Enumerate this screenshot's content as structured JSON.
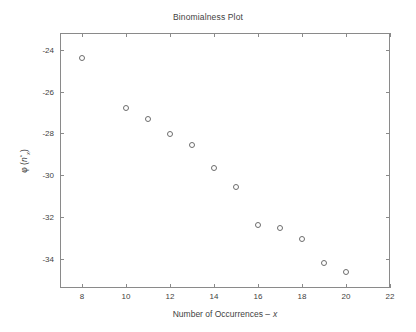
{
  "chart_data": {
    "type": "scatter",
    "title": "Binomialness Plot",
    "xlabel": "Number of Occurrences – x",
    "xlabel_plain": "Number of Occurrences –",
    "xlabel_var": "x",
    "ylabel": "φ (ñ*x)",
    "ylabel_phi": "φ (",
    "ylabel_var": "n",
    "ylabel_sup": "*",
    "ylabel_sub": "x",
    "ylabel_close": ")",
    "xlim": [
      7,
      22
    ],
    "ylim": [
      -35.4,
      -23.2
    ],
    "grid": false,
    "legend": null,
    "marker": "open-circle",
    "marker_color": "#6d6d6d",
    "xticks": [
      8,
      10,
      12,
      14,
      16,
      18,
      20,
      22
    ],
    "xticklabels": [
      "8",
      "10",
      "12",
      "14",
      "16",
      "18",
      "20",
      "22"
    ],
    "yticks": [
      -24,
      -26,
      -28,
      -30,
      -32,
      -34
    ],
    "yticklabels": [
      "-24",
      "-26",
      "-28",
      "-30",
      "-32",
      "-34"
    ],
    "x": [
      8,
      10,
      11,
      12,
      13,
      14,
      15,
      16,
      17,
      18,
      19,
      20
    ],
    "values": [
      -24.4,
      -26.8,
      -27.3,
      -28.05,
      -28.55,
      -29.65,
      -30.55,
      -32.4,
      -32.55,
      -33.05,
      -34.2,
      -34.65
    ],
    "points": [
      {
        "x": 8,
        "y": -24.4
      },
      {
        "x": 10,
        "y": -26.8
      },
      {
        "x": 11,
        "y": -27.3
      },
      {
        "x": 12,
        "y": -28.05
      },
      {
        "x": 13,
        "y": -28.55
      },
      {
        "x": 14,
        "y": -29.65
      },
      {
        "x": 15,
        "y": -30.55
      },
      {
        "x": 16,
        "y": -32.4
      },
      {
        "x": 17,
        "y": -32.55
      },
      {
        "x": 18,
        "y": -33.05
      },
      {
        "x": 19,
        "y": -34.2
      },
      {
        "x": 20,
        "y": -34.65
      }
    ]
  },
  "figure": {
    "background": "#ffffff",
    "axis_color": "#8a8a8a",
    "text_color": "#3f3f3f"
  }
}
